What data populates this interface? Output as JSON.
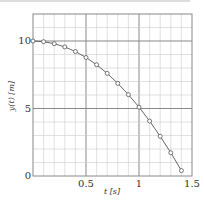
{
  "chart_data": {
    "type": "line",
    "title": "",
    "xlabel": "t [s]",
    "ylabel": "y(t) [m]",
    "xlim": [
      0,
      1.5
    ],
    "ylim": [
      0,
      12
    ],
    "x_ticks": [
      0.5,
      1,
      1.5
    ],
    "x_tick_labels": [
      "0.5",
      "1",
      "1.5"
    ],
    "y_ticks": [
      0,
      5,
      10
    ],
    "y_tick_labels": [
      "0",
      "5",
      "10"
    ],
    "grid": true,
    "grid_minor_x": 0.1,
    "grid_minor_y": 1,
    "legend": null,
    "series": [
      {
        "name": "y(t)",
        "marker": "circle",
        "line": true,
        "x": [
          0,
          0.1,
          0.2,
          0.3,
          0.4,
          0.5,
          0.6,
          0.7,
          0.8,
          0.9,
          1.0,
          1.1,
          1.2,
          1.3,
          1.4
        ],
        "values": [
          10.0,
          9.95,
          9.8,
          9.56,
          9.22,
          8.78,
          8.24,
          7.6,
          6.86,
          6.03,
          5.1,
          4.07,
          2.94,
          1.72,
          0.4
        ]
      }
    ]
  },
  "colors": {
    "line": "#555555",
    "marker": "#555555",
    "grid_minor": "#cccccc",
    "grid_major": "#888888",
    "frame": "#888888"
  }
}
